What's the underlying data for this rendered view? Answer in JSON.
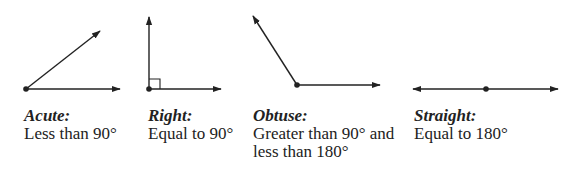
{
  "angles": [
    {
      "name": "Acute",
      "title": "Acute:",
      "description_lines": [
        "Less than 90°"
      ]
    },
    {
      "name": "Right",
      "title": "Right:",
      "description_lines": [
        "Equal to 90°"
      ]
    },
    {
      "name": "Obtuse",
      "title": "Obtuse:",
      "description_lines": [
        "Greater than 90° and",
        "less than 180°"
      ]
    },
    {
      "name": "Straight",
      "title": "Straight:",
      "description_lines": [
        "Equal to 180°"
      ]
    }
  ],
  "colors": {
    "stroke": "#222222",
    "text": "#222222"
  }
}
